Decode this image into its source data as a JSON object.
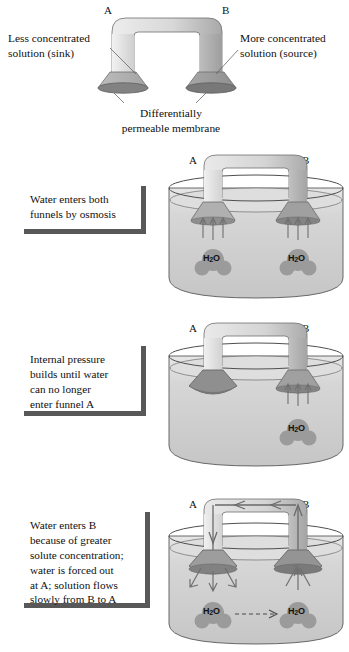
{
  "diagram": {
    "title": "Osmosis in a differentially permeable funnel system",
    "letters": {
      "a": "A",
      "b": "B"
    },
    "molecule_label": "H",
    "molecule_sub": "2",
    "molecule_label2": "O"
  },
  "panels": [
    {
      "id": "panel-1",
      "name": "apparatus-overview",
      "labels": {
        "left": "Less concentrated\nsolution (sink)",
        "left_line1": "Less concentrated",
        "left_line2": "solution (sink)",
        "right_line1": "More concentrated",
        "right_line2": "solution (source)",
        "bottom_line1": "Differentially",
        "bottom_line2": "permeable membrane"
      }
    },
    {
      "id": "panel-2",
      "name": "water-enters-both-funnels",
      "caption_line1": "Water enters both",
      "caption_line2": "funnels by osmosis",
      "caption": "Water enters both funnels by osmosis"
    },
    {
      "id": "panel-3",
      "name": "internal-pressure-builds",
      "caption_line1": "Internal pressure",
      "caption_line2": "builds until water",
      "caption_line3": "can no longer",
      "caption_line4": "enter funnel A",
      "caption": "Internal pressure builds until water can no longer enter funnel A"
    },
    {
      "id": "panel-4",
      "name": "water-enters-b-flows-to-a",
      "caption_line1": "Water enters B",
      "caption_line2": "because of greater",
      "caption_line3": "solute concentration;",
      "caption_line4": "water is forced out",
      "caption_line5": "at A; solution flows",
      "caption_line6": "slowly from B to A",
      "caption": "Water enters B because of greater solute concentration; water is forced out at A; solution flows slowly from B to A"
    }
  ],
  "colors": {
    "tube_light": "#e6e6e6",
    "tube_mid": "#c9c9c9",
    "tube_dark": "#a6a6a6",
    "funnel_light": "#b4b4b4",
    "funnel_dark": "#969696",
    "membrane": "#7d7d7d",
    "beaker_fill": "#d2d2d2",
    "beaker_fill_upper": "#e2e2e2",
    "outline": "#4a4a4a",
    "arrow": "#6b6b6b",
    "caption_edge": "#585858",
    "text": "#111111"
  }
}
